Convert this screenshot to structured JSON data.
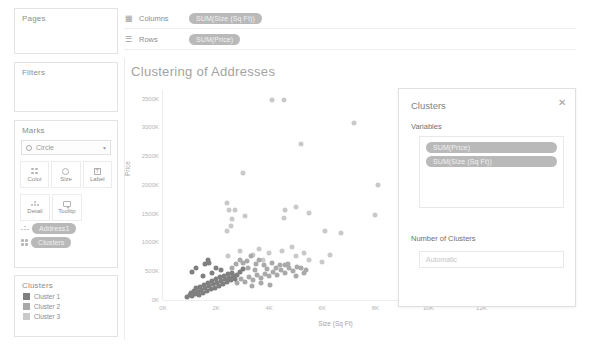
{
  "shelves": {
    "columns": {
      "label": "Columns",
      "icon": "columns-icon",
      "pill": "SUM(Size (Sq Ft))"
    },
    "rows": {
      "label": "Rows",
      "icon": "rows-icon",
      "pill": "SUM(Price)"
    }
  },
  "cards": {
    "pages": "Pages",
    "filters": "Filters",
    "marks": "Marks",
    "legend_title": "Clusters"
  },
  "marks": {
    "mark_type": "Circle",
    "buttons_row1": [
      {
        "label": "Color",
        "icon": "color-icon"
      },
      {
        "label": "Size",
        "icon": "size-icon"
      },
      {
        "label": "Label",
        "icon": "label-icon"
      }
    ],
    "buttons_row2": [
      {
        "label": "Detail",
        "icon": "detail-icon"
      },
      {
        "label": "Tooltip",
        "icon": "tooltip-icon"
      }
    ],
    "pills": [
      {
        "label": "Address1",
        "icon": "detail-icon"
      },
      {
        "label": "Clusters",
        "icon": "color-icon"
      }
    ]
  },
  "legend": {
    "items": [
      {
        "label": "Cluster 1",
        "color": "#7f7f7f"
      },
      {
        "label": "Cluster 2",
        "color": "#a9a9a9"
      },
      {
        "label": "Cluster 3",
        "color": "#c9c9c9"
      }
    ]
  },
  "dialog": {
    "title": "Clusters",
    "close_icon": "close-icon",
    "variables_label": "Variables",
    "variables": [
      "SUM(Price)",
      "SUM(Size (Sq Ft))"
    ],
    "num_clusters_label": "Number of Clusters",
    "num_clusters_value": "",
    "num_clusters_placeholder": "Automatic"
  },
  "chart_data": {
    "type": "scatter",
    "title": "Clustering of Addresses",
    "xlabel": "Size (Sq Ft)",
    "ylabel": "Price",
    "xlim": [
      0,
      13000
    ],
    "ylim": [
      0,
      3650000
    ],
    "xticks": [
      0,
      2000,
      4000,
      6000,
      8000,
      10000,
      12000
    ],
    "xticklabels": [
      "0K",
      "2K",
      "4K",
      "6K",
      "8K",
      "10K",
      "12K"
    ],
    "yticks": [
      0,
      500000,
      1000000,
      1500000,
      2000000,
      2500000,
      3000000,
      3500000
    ],
    "yticklabels": [
      "0K",
      "500K",
      "1000K",
      "1500K",
      "2000K",
      "2500K",
      "3000K",
      "3500K"
    ],
    "grid": false,
    "legend": "Clusters",
    "legend_position": "left-panel",
    "marker": "circle",
    "series": [
      {
        "name": "Cluster 1",
        "color": "#7f7f7f",
        "points": [
          [
            900,
            60000
          ],
          [
            1000,
            90000
          ],
          [
            1050,
            130000
          ],
          [
            1100,
            75000
          ],
          [
            1150,
            160000
          ],
          [
            1200,
            110000
          ],
          [
            1250,
            200000
          ],
          [
            1300,
            145000
          ],
          [
            1350,
            95000
          ],
          [
            1400,
            230000
          ],
          [
            1450,
            175000
          ],
          [
            1500,
            120000
          ],
          [
            1550,
            260000
          ],
          [
            1600,
            205000
          ],
          [
            1650,
            155000
          ],
          [
            1700,
            300000
          ],
          [
            1750,
            240000
          ],
          [
            1800,
            190000
          ],
          [
            1850,
            330000
          ],
          [
            1900,
            275000
          ],
          [
            1950,
            215000
          ],
          [
            2000,
            360000
          ],
          [
            2050,
            300000
          ],
          [
            2100,
            250000
          ],
          [
            2150,
            395000
          ],
          [
            2200,
            330000
          ],
          [
            2250,
            285000
          ],
          [
            2300,
            420000
          ],
          [
            2350,
            365000
          ],
          [
            2400,
            310000
          ],
          [
            2450,
            450000
          ],
          [
            2500,
            390000
          ],
          [
            2550,
            340000
          ],
          [
            2600,
            470000
          ],
          [
            2650,
            415000
          ],
          [
            2700,
            360000
          ],
          [
            1100,
            480000
          ],
          [
            1250,
            560000
          ],
          [
            1600,
            620000
          ],
          [
            1700,
            700000
          ],
          [
            1750,
            640000
          ],
          [
            2000,
            560000
          ],
          [
            2200,
            520000
          ],
          [
            2800,
            430000
          ],
          [
            2900,
            490000
          ],
          [
            3000,
            540000
          ],
          [
            1500,
            420000
          ],
          [
            1850,
            470000
          ]
        ]
      },
      {
        "name": "Cluster 2",
        "color": "#a9a9a9",
        "points": [
          [
            2800,
            300000
          ],
          [
            2950,
            360000
          ],
          [
            3100,
            320000
          ],
          [
            3250,
            400000
          ],
          [
            3400,
            350000
          ],
          [
            3550,
            430000
          ],
          [
            3700,
            380000
          ],
          [
            3850,
            460000
          ],
          [
            4000,
            410000
          ],
          [
            4150,
            490000
          ],
          [
            4300,
            440000
          ],
          [
            4450,
            520000
          ],
          [
            4600,
            470000
          ],
          [
            4750,
            550000
          ],
          [
            4900,
            500000
          ],
          [
            5050,
            580000
          ],
          [
            3200,
            560000
          ],
          [
            3500,
            620000
          ],
          [
            3800,
            600000
          ],
          [
            4100,
            640000
          ],
          [
            4400,
            600000
          ],
          [
            2900,
            700000
          ],
          [
            3300,
            760000
          ],
          [
            3600,
            700000
          ],
          [
            4700,
            620000
          ],
          [
            5200,
            560000
          ],
          [
            5400,
            520000
          ],
          [
            3000,
            640000
          ],
          [
            3450,
            520000
          ],
          [
            3900,
            540000
          ],
          [
            4250,
            560000
          ],
          [
            4600,
            600000
          ],
          [
            2600,
            560000
          ],
          [
            2750,
            620000
          ],
          [
            3150,
            680000
          ],
          [
            5000,
            420000
          ],
          [
            5300,
            470000
          ],
          [
            3700,
            300000
          ],
          [
            4050,
            260000
          ],
          [
            3350,
            240000
          ]
        ]
      },
      {
        "name": "Cluster 3",
        "color": "#c9c9c9",
        "points": [
          [
            4100,
            3480000
          ],
          [
            4550,
            3480000
          ],
          [
            7200,
            3080000
          ],
          [
            5200,
            2720000
          ],
          [
            3000,
            2200000
          ],
          [
            8100,
            2000000
          ],
          [
            11800,
            2380000
          ],
          [
            10100,
            2720000
          ],
          [
            2400,
            1680000
          ],
          [
            4600,
            1560000
          ],
          [
            5500,
            1520000
          ],
          [
            8000,
            1480000
          ],
          [
            4550,
            1430000
          ],
          [
            2600,
            1400000
          ],
          [
            2550,
            1280000
          ],
          [
            2400,
            1200000
          ],
          [
            6700,
            1160000
          ],
          [
            5000,
            1620000
          ],
          [
            3100,
            1460000
          ],
          [
            2500,
            1560000
          ],
          [
            2700,
            1560000
          ],
          [
            6100,
            1200000
          ],
          [
            3400,
            780000
          ],
          [
            4000,
            820000
          ],
          [
            4500,
            860000
          ],
          [
            5000,
            760000
          ],
          [
            5500,
            700000
          ],
          [
            6000,
            660000
          ],
          [
            3600,
            880000
          ],
          [
            2900,
            860000
          ],
          [
            2450,
            760000
          ],
          [
            3750,
            700000
          ],
          [
            5300,
            820000
          ],
          [
            4850,
            920000
          ],
          [
            6300,
            780000
          ]
        ]
      }
    ]
  }
}
